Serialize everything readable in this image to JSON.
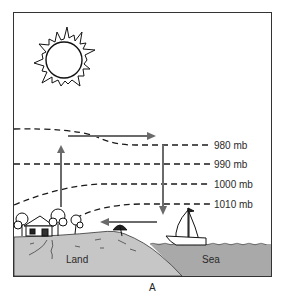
{
  "diagram": {
    "caption": "A",
    "colors": {
      "frame": "#333333",
      "land": "#c6c6c6",
      "sea": "#a9a9a9",
      "arrow": "#6a6a6a",
      "isobar": "#1a1a1a"
    },
    "isobars": [
      {
        "label": "980 mb"
      },
      {
        "label": "990 mb"
      },
      {
        "label": "1000 mb"
      },
      {
        "label": "1010 mb"
      }
    ],
    "regions": {
      "land_label": "Land",
      "sea_label": "Sea"
    },
    "icons": [
      "sun-icon",
      "house-icon",
      "tree-icon",
      "beach-umbrella-icon",
      "sailboat-icon"
    ],
    "circulation": [
      {
        "direction": "up",
        "over": "land"
      },
      {
        "direction": "right",
        "position": "aloft"
      },
      {
        "direction": "down",
        "over": "sea"
      },
      {
        "direction": "left",
        "position": "surface"
      }
    ]
  }
}
